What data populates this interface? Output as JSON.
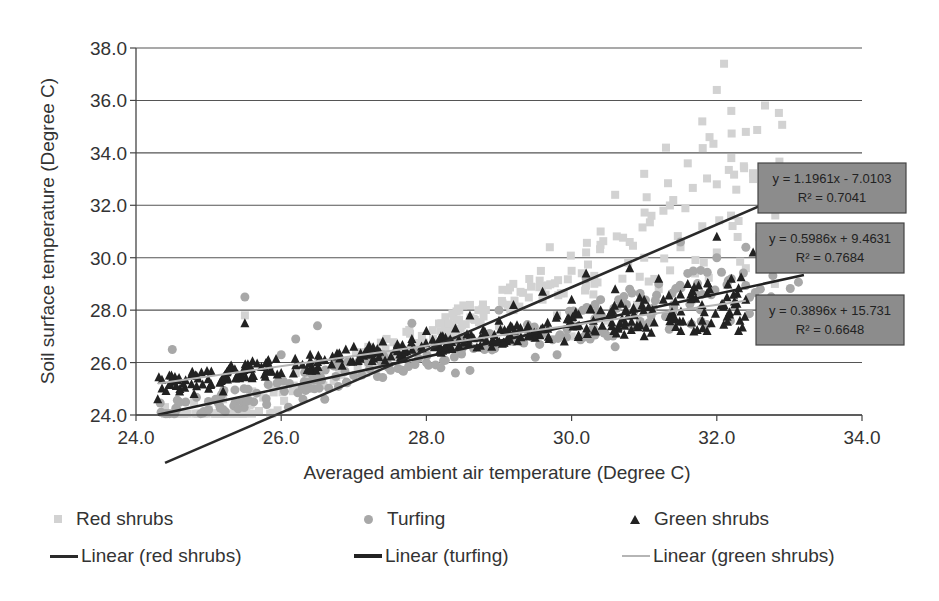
{
  "chart_data": {
    "type": "scatter",
    "title": "",
    "xlabel": "Averaged ambient air temperature (Degree C)",
    "ylabel": "Soil surface temperature (Degree C)",
    "xlim": [
      24.0,
      34.0
    ],
    "ylim": [
      24.0,
      38.0
    ],
    "xticks": [
      "24.0",
      "26.0",
      "28.0",
      "30.0",
      "32.0",
      "34.0"
    ],
    "yticks": [
      "24.0",
      "26.0",
      "28.0",
      "30.0",
      "32.0",
      "34.0",
      "36.0",
      "38.0"
    ],
    "grid": "horizontal",
    "legend_position": "bottom",
    "series": [
      {
        "name": "Red shrubs",
        "marker": "square",
        "color": "#d2d2d2",
        "points": [
          [
            24.4,
            24.3
          ],
          [
            24.8,
            24.5
          ],
          [
            25.2,
            24.6
          ],
          [
            25.6,
            24.9
          ],
          [
            26.0,
            25.1
          ],
          [
            26.4,
            25.4
          ],
          [
            26.8,
            25.8
          ],
          [
            27.2,
            26.0
          ],
          [
            27.6,
            26.2
          ],
          [
            28.0,
            26.4
          ],
          [
            28.4,
            26.6
          ],
          [
            28.8,
            26.9
          ],
          [
            29.0,
            27.4
          ],
          [
            29.2,
            28.0
          ],
          [
            29.4,
            27.1
          ],
          [
            29.6,
            28.4
          ],
          [
            29.8,
            27.8
          ],
          [
            30.0,
            29.5
          ],
          [
            30.0,
            27.0
          ],
          [
            30.2,
            30.2
          ],
          [
            30.3,
            28.6
          ],
          [
            30.4,
            31.0
          ],
          [
            30.5,
            27.6
          ],
          [
            30.6,
            32.4
          ],
          [
            30.7,
            29.2
          ],
          [
            30.8,
            30.6
          ],
          [
            30.9,
            28.2
          ],
          [
            31.0,
            33.2
          ],
          [
            31.0,
            30.0
          ],
          [
            31.1,
            31.6
          ],
          [
            31.2,
            28.8
          ],
          [
            31.3,
            34.2
          ],
          [
            31.4,
            32.2
          ],
          [
            31.5,
            30.4
          ],
          [
            31.6,
            33.6
          ],
          [
            31.7,
            29.4
          ],
          [
            31.8,
            35.2
          ],
          [
            31.8,
            31.2
          ],
          [
            31.9,
            34.6
          ],
          [
            32.0,
            36.4
          ],
          [
            32.0,
            32.8
          ],
          [
            32.0,
            30.2
          ],
          [
            32.1,
            37.4
          ],
          [
            32.2,
            35.6
          ],
          [
            32.2,
            33.8
          ],
          [
            32.3,
            31.4
          ],
          [
            32.4,
            34.8
          ],
          [
            32.4,
            29.6
          ],
          [
            32.5,
            33.0
          ],
          [
            32.6,
            30.8
          ],
          [
            32.7,
            32.0
          ],
          [
            32.8,
            29.0
          ],
          [
            33.0,
            30.4
          ],
          [
            29.7,
            30.4
          ],
          [
            28.6,
            28.2
          ],
          [
            27.2,
            26.6
          ],
          [
            25.5,
            27.8
          ],
          [
            26.2,
            25.6
          ],
          [
            25.0,
            24.2
          ],
          [
            28.2,
            27.2
          ]
        ]
      },
      {
        "name": "Turfing",
        "marker": "circle",
        "color": "#a8a8a8",
        "points": [
          [
            24.5,
            26.5
          ],
          [
            25.0,
            24.2
          ],
          [
            25.2,
            24.2
          ],
          [
            25.5,
            28.5
          ],
          [
            25.8,
            24.4
          ],
          [
            26.0,
            26.3
          ],
          [
            26.1,
            24.3
          ],
          [
            26.2,
            26.9
          ],
          [
            26.3,
            24.6
          ],
          [
            26.5,
            27.4
          ],
          [
            26.6,
            24.6
          ],
          [
            26.8,
            26.0
          ],
          [
            27.0,
            25.5
          ],
          [
            27.2,
            26.0
          ],
          [
            27.4,
            26.3
          ],
          [
            27.6,
            26.6
          ],
          [
            27.8,
            27.5
          ],
          [
            28.0,
            26.0
          ],
          [
            28.2,
            25.8
          ],
          [
            28.4,
            25.6
          ],
          [
            28.6,
            25.7
          ],
          [
            28.8,
            26.5
          ],
          [
            29.0,
            28.0
          ],
          [
            29.2,
            26.8
          ],
          [
            29.4,
            27.2
          ],
          [
            29.6,
            27.1
          ],
          [
            29.8,
            26.3
          ],
          [
            30.0,
            27.6
          ],
          [
            30.2,
            27.0
          ],
          [
            30.4,
            28.4
          ],
          [
            30.6,
            26.6
          ],
          [
            30.8,
            28.8
          ],
          [
            31.0,
            27.4
          ],
          [
            31.2,
            29.0
          ],
          [
            31.4,
            28.2
          ],
          [
            31.6,
            29.4
          ],
          [
            31.8,
            28.6
          ],
          [
            32.0,
            30.0
          ],
          [
            32.2,
            29.2
          ],
          [
            32.4,
            30.4
          ],
          [
            32.6,
            28.8
          ],
          [
            32.8,
            29.6
          ],
          [
            33.0,
            30.2
          ],
          [
            29.5,
            26.2
          ],
          [
            30.2,
            29.2
          ],
          [
            31.5,
            30.6
          ]
        ]
      },
      {
        "name": "Green shrubs",
        "marker": "triangle",
        "color": "#222222",
        "points": [
          [
            24.3,
            24.6
          ],
          [
            24.5,
            25.4
          ],
          [
            24.6,
            24.9
          ],
          [
            24.8,
            24.8
          ],
          [
            25.0,
            25.0
          ],
          [
            25.2,
            24.9
          ],
          [
            25.5,
            27.5
          ],
          [
            25.6,
            25.4
          ],
          [
            25.8,
            25.7
          ],
          [
            26.0,
            25.6
          ],
          [
            26.2,
            25.9
          ],
          [
            26.4,
            25.7
          ],
          [
            26.6,
            26.1
          ],
          [
            26.8,
            26.3
          ],
          [
            27.0,
            26.6
          ],
          [
            27.2,
            26.3
          ],
          [
            27.4,
            26.8
          ],
          [
            27.6,
            26.7
          ],
          [
            27.8,
            26.9
          ],
          [
            28.0,
            27.2
          ],
          [
            28.2,
            27.0
          ],
          [
            28.4,
            27.3
          ],
          [
            28.6,
            27.8
          ],
          [
            28.8,
            27.1
          ],
          [
            29.0,
            27.6
          ],
          [
            29.2,
            28.2
          ],
          [
            29.4,
            27.4
          ],
          [
            29.6,
            28.7
          ],
          [
            29.8,
            27.8
          ],
          [
            30.0,
            28.4
          ],
          [
            30.2,
            29.4
          ],
          [
            30.3,
            27.6
          ],
          [
            30.4,
            28.0
          ],
          [
            30.6,
            28.8
          ],
          [
            30.8,
            29.6
          ],
          [
            30.9,
            27.4
          ],
          [
            31.0,
            28.4
          ],
          [
            31.2,
            29.2
          ],
          [
            31.4,
            27.8
          ],
          [
            31.5,
            28.6
          ],
          [
            31.6,
            29.0
          ],
          [
            31.8,
            27.6
          ],
          [
            31.9,
            28.8
          ],
          [
            32.0,
            30.8
          ],
          [
            32.1,
            28.2
          ],
          [
            32.2,
            29.2
          ],
          [
            32.3,
            27.2
          ],
          [
            32.4,
            28.4
          ],
          [
            32.6,
            27.8
          ],
          [
            32.8,
            28.2
          ],
          [
            33.0,
            27.4
          ],
          [
            32.5,
            30.2
          ],
          [
            31.0,
            27.0
          ],
          [
            29.9,
            26.8
          ],
          [
            28.9,
            26.6
          ]
        ]
      }
    ],
    "trendlines": [
      {
        "name": "Linear (red shrubs)",
        "series": "Red shrubs",
        "slope": 1.1961,
        "intercept": -7.0103,
        "equation": "y = 1.1961x - 7.0103",
        "r2_label": "R² = 0.7041",
        "r2": 0.7041,
        "x_range": [
          24.4,
          33.2
        ],
        "color": "#2a2a2a"
      },
      {
        "name": "Linear (turfing)",
        "series": "Turfing",
        "slope": 0.5986,
        "intercept": 9.4631,
        "equation": "y = 0.5986x + 9.4631",
        "r2_label": "R² = 0.7684",
        "r2": 0.7684,
        "x_range": [
          24.3,
          33.2
        ],
        "color": "#222222"
      },
      {
        "name": "Linear (green shrubs)",
        "series": "Green shrubs",
        "slope": 0.3896,
        "intercept": 15.731,
        "equation": "y = 0.3896x + 15.731",
        "r2_label": "R² = 0.6648",
        "r2": 0.6648,
        "x_range": [
          24.3,
          32.4
        ],
        "color": "#b5b5b5"
      }
    ]
  },
  "legend": {
    "items": [
      {
        "label": "Red shrubs",
        "type": "square"
      },
      {
        "label": "Turfing",
        "type": "circle"
      },
      {
        "label": "Green shrubs",
        "type": "triangle"
      },
      {
        "label": "Linear (red shrubs)",
        "type": "line",
        "color": "#2a2a2a"
      },
      {
        "label": "Linear (turfing)",
        "type": "line",
        "color": "#222222"
      },
      {
        "label": "Linear (green shrubs)",
        "type": "line",
        "color": "#b5b5b5"
      }
    ]
  }
}
